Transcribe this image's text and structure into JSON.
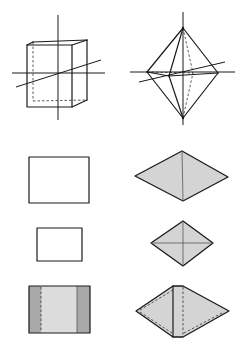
{
  "figure": {
    "colors": {
      "line": "#1a1a1a",
      "face_fill": "#d4d4d4",
      "side_strip_fill": "#a9a9a9",
      "middle_fill": "#dcdcdc",
      "background": "#ffffff"
    },
    "panels": [
      {
        "id": "prism-3d",
        "label": "rectangular prism with three axes",
        "column": "left",
        "row": 1
      },
      {
        "id": "octahedron-3d",
        "label": "octahedron with three axes",
        "column": "right",
        "row": 1
      },
      {
        "id": "prism-front-view",
        "label": "prism front projection (rectangle)",
        "column": "left",
        "row": 2
      },
      {
        "id": "octahedron-front-view",
        "label": "octahedron front projection (rhombus)",
        "column": "right",
        "row": 2
      },
      {
        "id": "prism-top-view",
        "label": "prism top projection (small rectangle)",
        "column": "left",
        "row": 3
      },
      {
        "id": "octahedron-top-view",
        "label": "octahedron top projection (rhombus with diagonals)",
        "column": "right",
        "row": 3
      },
      {
        "id": "prism-shaded-view",
        "label": "prism projection with shaded side faces",
        "column": "left",
        "row": 4
      },
      {
        "id": "octahedron-shaded-view",
        "label": "octahedron oblique projection",
        "column": "right",
        "row": 4
      }
    ]
  }
}
